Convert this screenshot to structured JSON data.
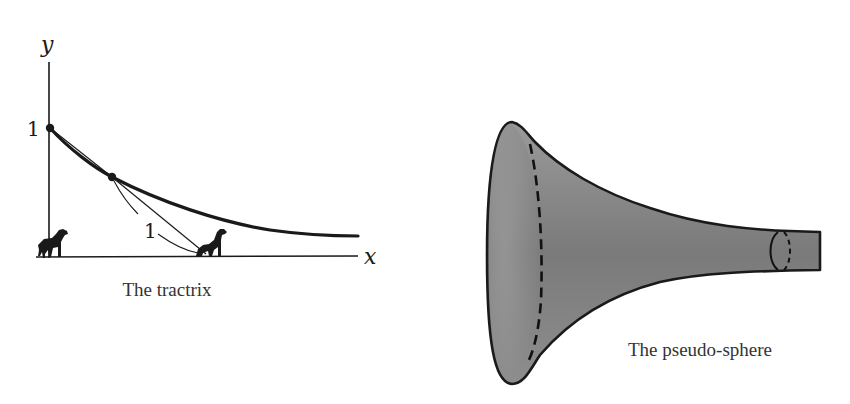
{
  "figures": [
    {
      "id": "tractrix",
      "caption": "The tractrix",
      "axes": {
        "x_label": "x",
        "y_label": "y"
      },
      "labels": {
        "y_intercept": "1",
        "leash_length": "1"
      },
      "elements": [
        "tractrix-curve",
        "tangent-segment",
        "leash-arc",
        "dog-at-origin",
        "dog-on-x-axis",
        "point-at-(0,1)",
        "point-on-curve"
      ]
    },
    {
      "id": "pseudo-sphere",
      "caption": "The pseudo-sphere",
      "elements": [
        "trumpet-surface",
        "dashed-rim-meridian",
        "small-ring-near-end"
      ]
    }
  ],
  "colors": {
    "ink": "#1a1a1a",
    "surface_light": "#b5b5b5",
    "surface_dark": "#6f6f6f"
  }
}
